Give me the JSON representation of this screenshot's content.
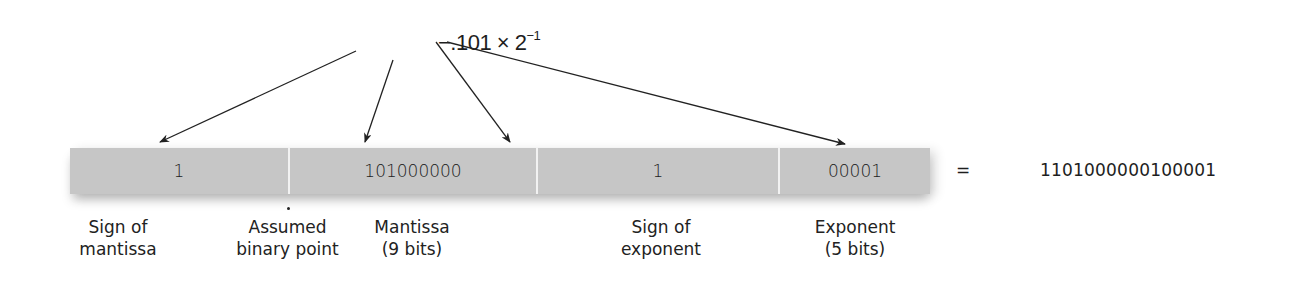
{
  "expression": {
    "prefix": "−.101 × 2",
    "exponent": "−1"
  },
  "register": {
    "fields": [
      {
        "name": "sign-of-mantissa",
        "value": "1",
        "width": 218
      },
      {
        "name": "mantissa",
        "value": "101000000",
        "width": 248
      },
      {
        "name": "sign-of-exponent",
        "value": "1",
        "width": 242
      },
      {
        "name": "exponent",
        "value": "00001",
        "width": 152
      }
    ],
    "color": "#c6c6c6"
  },
  "labels": {
    "sign_of_mantissa": [
      "Sign of",
      "mantissa"
    ],
    "assumed_binary_point": [
      "Assumed",
      "binary point"
    ],
    "mantissa": [
      "Mantissa",
      "(9 bits)"
    ],
    "sign_of_exponent": [
      "Sign of",
      "exponent"
    ],
    "exponent": [
      "Exponent",
      "(5 bits)"
    ]
  },
  "equals": "=",
  "result": "1101000000100001"
}
